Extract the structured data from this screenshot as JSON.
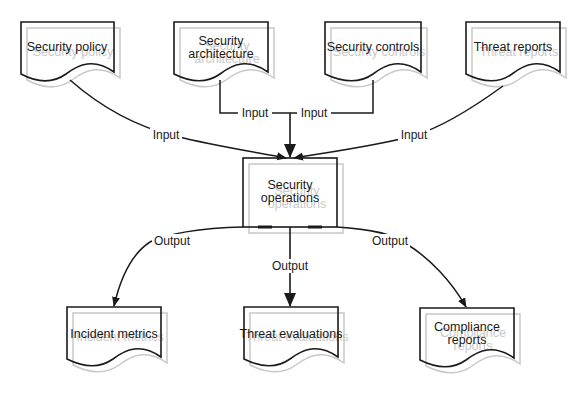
{
  "diagram": {
    "type": "data-flow",
    "colors": {
      "stroke": "#1a1a1a",
      "shadow": "#c8c8c8",
      "background": "#ffffff"
    },
    "inputs": [
      {
        "id": "security-policy",
        "label_lines": [
          "Security policy"
        ]
      },
      {
        "id": "security-architecture",
        "label_lines": [
          "Security",
          "architecture"
        ]
      },
      {
        "id": "security-controls",
        "label_lines": [
          "Security controls"
        ]
      },
      {
        "id": "threat-reports",
        "label_lines": [
          "Threat reports"
        ]
      }
    ],
    "process": {
      "id": "security-operations",
      "label_lines": [
        "Security",
        "operations"
      ]
    },
    "outputs": [
      {
        "id": "incident-metrics",
        "label_lines": [
          "Incident metrics"
        ]
      },
      {
        "id": "threat-evaluations",
        "label_lines": [
          "Threat evaluations"
        ]
      },
      {
        "id": "compliance-reports",
        "label_lines": [
          "Compliance",
          "reports"
        ]
      }
    ],
    "edges": [
      {
        "from": "security-policy",
        "to": "security-operations",
        "label": "Input"
      },
      {
        "from": "security-architecture",
        "to": "security-operations",
        "label": "Input"
      },
      {
        "from": "security-controls",
        "to": "security-operations",
        "label": "Input"
      },
      {
        "from": "threat-reports",
        "to": "security-operations",
        "label": "Input"
      },
      {
        "from": "security-operations",
        "to": "incident-metrics",
        "label": "Output"
      },
      {
        "from": "security-operations",
        "to": "threat-evaluations",
        "label": "Output"
      },
      {
        "from": "security-operations",
        "to": "compliance-reports",
        "label": "Output"
      }
    ]
  }
}
